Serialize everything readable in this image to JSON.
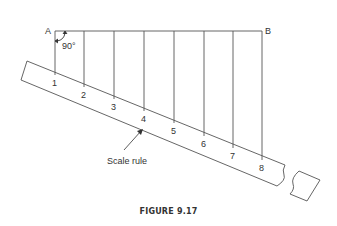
{
  "figure": {
    "caption": "FIGURE 9.17",
    "point_a": "A",
    "point_b": "B",
    "angle_label": "90°",
    "ruler_label": "Scale rule",
    "ticks": [
      "1",
      "2",
      "3",
      "4",
      "5",
      "6",
      "7",
      "8"
    ]
  },
  "colors": {
    "line": "#555555",
    "text": "#333333"
  }
}
